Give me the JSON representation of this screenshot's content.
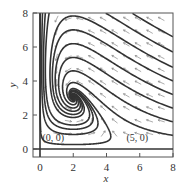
{
  "chart_data": {
    "type": "line",
    "subtype": "phase-portrait",
    "title": "",
    "xlabel": "x",
    "ylabel": "y",
    "xlim": [
      -0.5,
      8
    ],
    "ylim": [
      -0.5,
      8
    ],
    "xticks": [
      0,
      2,
      4,
      6,
      8
    ],
    "yticks": [
      0,
      2,
      4,
      6,
      8
    ],
    "xtick_labels": [
      "0",
      "2",
      "4",
      "6",
      "8"
    ],
    "ytick_labels": [
      "0",
      "2",
      "4",
      "6",
      "8"
    ],
    "grid": false,
    "legend": null,
    "system": {
      "dxdt": "x(5 - x - y)",
      "dydt": "y(x - 2)"
    },
    "equilibria": [
      {
        "label": "(0, 0)",
        "x": 0,
        "y": 0,
        "type": "saddle"
      },
      {
        "label": "(5, 0)",
        "x": 5,
        "y": 0,
        "type": "saddle"
      },
      {
        "label": "",
        "x": 2,
        "y": 3,
        "type": "stable spiral"
      }
    ],
    "annotations": [
      {
        "text": "(0, 0)",
        "x": 0.15,
        "y": 0.35
      },
      {
        "text": "(5, 0)",
        "x": 5.2,
        "y": 0.35
      }
    ],
    "direction_field": {
      "x_start": 1.0,
      "x_step": 0.7,
      "nx": 10,
      "y_start": 0.9,
      "y_step": 0.75,
      "ny": 10,
      "color": "#888888"
    },
    "trajectories": [
      {
        "x0": 0.15,
        "y0": 8.0,
        "dir": 1
      },
      {
        "x0": 0.32,
        "y0": 8.0,
        "dir": 1
      },
      {
        "x0": 0.55,
        "y0": 8.0,
        "dir": 1
      },
      {
        "x0": 5.6,
        "y0": 8.0,
        "dir": 1
      },
      {
        "x0": 8.0,
        "y0": 6.6,
        "dir": 1
      },
      {
        "x0": 8.0,
        "y0": 5.7,
        "dir": 1
      },
      {
        "x0": 8.0,
        "y0": 4.8,
        "dir": 1
      },
      {
        "x0": 8.0,
        "y0": 4.0,
        "dir": 1
      },
      {
        "x0": 8.0,
        "y0": 3.2,
        "dir": 1
      },
      {
        "x0": 8.0,
        "y0": 2.4,
        "dir": 1
      },
      {
        "x0": 8.0,
        "y0": 1.6,
        "dir": 1
      },
      {
        "x0": 8.0,
        "y0": 0.8,
        "dir": 1
      },
      {
        "x0": 4.2,
        "y0": 1.0,
        "dir": -1
      },
      {
        "x0": 4.2,
        "y0": 1.0,
        "dir": 1
      }
    ],
    "axes_lines": [
      {
        "orientation": "horizontal",
        "at": 0
      },
      {
        "orientation": "vertical",
        "at": 0
      }
    ]
  }
}
